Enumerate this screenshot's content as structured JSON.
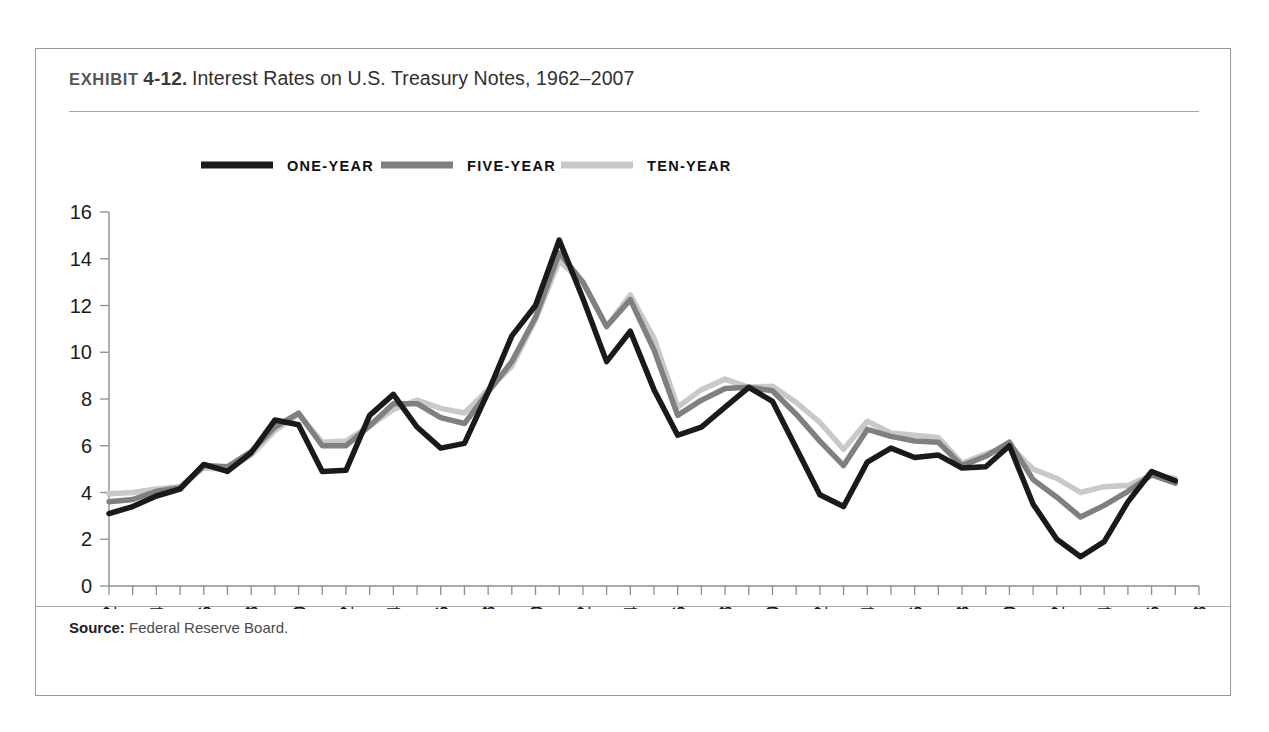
{
  "exhibit": {
    "label": "EXHIBIT",
    "number": "4-12.",
    "title": "Interest Rates on U.S. Treasury Notes, 1962–2007"
  },
  "source": {
    "label": "Source:",
    "text": "Federal Reserve Board."
  },
  "colors": {
    "one_year": "#1a1a1a",
    "five_year": "#808080",
    "ten_year": "#c9c9c9",
    "axis": "#8d8d8d",
    "frame": "#9a9a9a",
    "rule": "#a8a8a8"
  },
  "chart_data": {
    "type": "line",
    "title": "Interest Rates on U.S. Treasury Notes, 1962–2007",
    "xlabel": "",
    "ylabel": "",
    "xlim": [
      1962,
      2008
    ],
    "ylim": [
      0,
      16
    ],
    "ytick_step": 2,
    "xtick_step": 2,
    "grid": false,
    "legend_position": "top-left",
    "yticks": [
      0,
      2,
      4,
      6,
      8,
      10,
      12,
      14,
      16
    ],
    "xticks": [
      1962,
      1964,
      1966,
      1968,
      1970,
      1972,
      1974,
      1976,
      1978,
      1980,
      1982,
      1984,
      1986,
      1988,
      1990,
      1992,
      1994,
      1996,
      1998,
      2000,
      2002,
      2004,
      2006,
      2008
    ],
    "x": [
      1962,
      1963,
      1964,
      1965,
      1966,
      1967,
      1968,
      1969,
      1970,
      1971,
      1972,
      1973,
      1974,
      1975,
      1976,
      1977,
      1978,
      1979,
      1980,
      1981,
      1982,
      1983,
      1984,
      1985,
      1986,
      1987,
      1988,
      1989,
      1990,
      1991,
      1992,
      1993,
      1994,
      1995,
      1996,
      1997,
      1998,
      1999,
      2000,
      2001,
      2002,
      2003,
      2004,
      2005,
      2006,
      2007
    ],
    "series": [
      {
        "name": "ONE-YEAR",
        "color": "#1a1a1a",
        "values": [
          3.1,
          3.4,
          3.85,
          4.15,
          5.2,
          4.9,
          5.7,
          7.1,
          6.9,
          4.9,
          4.95,
          7.3,
          8.2,
          6.8,
          5.9,
          6.1,
          8.3,
          10.7,
          12.0,
          14.8,
          12.3,
          9.6,
          10.9,
          8.4,
          6.45,
          6.8,
          7.65,
          8.5,
          7.9,
          5.9,
          3.9,
          3.4,
          5.3,
          5.9,
          5.5,
          5.6,
          5.05,
          5.1,
          6.0,
          3.5,
          2.0,
          1.25,
          1.9,
          3.6,
          4.9,
          4.5
        ]
      },
      {
        "name": "FIVE-YEAR",
        "color": "#808080",
        "values": [
          3.6,
          3.7,
          4.05,
          4.2,
          5.15,
          5.1,
          5.75,
          6.8,
          7.4,
          6.0,
          6.0,
          6.85,
          7.8,
          7.8,
          7.2,
          6.95,
          8.3,
          9.6,
          11.5,
          14.25,
          13.0,
          11.1,
          12.25,
          10.1,
          7.3,
          7.95,
          8.45,
          8.5,
          8.35,
          7.35,
          6.2,
          5.15,
          6.7,
          6.4,
          6.2,
          6.15,
          5.15,
          5.55,
          6.15,
          4.55,
          3.8,
          2.95,
          3.45,
          4.05,
          4.75,
          4.4
        ]
      },
      {
        "name": "TEN-YEAR",
        "color": "#c9c9c9",
        "values": [
          3.95,
          4.0,
          4.15,
          4.25,
          5.05,
          5.0,
          5.6,
          6.65,
          7.35,
          6.15,
          6.2,
          6.85,
          7.55,
          7.95,
          7.6,
          7.4,
          8.4,
          9.4,
          11.4,
          13.9,
          13.0,
          11.1,
          12.45,
          10.6,
          7.65,
          8.4,
          8.85,
          8.5,
          8.55,
          7.85,
          7.0,
          5.85,
          7.05,
          6.55,
          6.45,
          6.35,
          5.25,
          5.65,
          6.0,
          5.0,
          4.6,
          4.0,
          4.25,
          4.3,
          4.75,
          4.6
        ]
      }
    ],
    "legend": [
      {
        "label": "ONE-YEAR",
        "color": "#1a1a1a"
      },
      {
        "label": "FIVE-YEAR",
        "color": "#808080"
      },
      {
        "label": "TEN-YEAR",
        "color": "#c9c9c9"
      }
    ]
  }
}
